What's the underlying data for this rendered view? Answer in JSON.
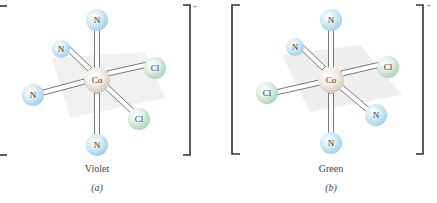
{
  "figure": {
    "panels": [
      {
        "id": "a",
        "caption": "Violet",
        "sublabel": "(a)",
        "charge": "+",
        "center": {
          "label": "Co",
          "x": 97,
          "y": 80,
          "r": 13
        },
        "ligands": [
          {
            "label": "N",
            "x": 97,
            "y": 20,
            "r": 11
          },
          {
            "label": "N",
            "x": 61,
            "y": 49,
            "r": 9
          },
          {
            "label": "Cl",
            "x": 155,
            "y": 68,
            "r": 11
          },
          {
            "label": "N",
            "x": 33,
            "y": 95,
            "r": 11
          },
          {
            "label": "Cl",
            "x": 139,
            "y": 119,
            "r": 11
          },
          {
            "label": "N",
            "x": 97,
            "y": 145,
            "r": 11
          }
        ]
      },
      {
        "id": "b",
        "caption": "Green",
        "sublabel": "(b)",
        "charge": "+",
        "center": {
          "label": "Co",
          "x": 331,
          "y": 80,
          "r": 13
        },
        "ligands": [
          {
            "label": "N",
            "x": 331,
            "y": 20,
            "r": 11
          },
          {
            "label": "N",
            "x": 295,
            "y": 47,
            "r": 9
          },
          {
            "label": "Cl",
            "x": 388,
            "y": 67,
            "r": 11
          },
          {
            "label": "Cl",
            "x": 267,
            "y": 93,
            "r": 11
          },
          {
            "label": "N",
            "x": 376,
            "y": 115,
            "r": 11
          },
          {
            "label": "N",
            "x": 331,
            "y": 143,
            "r": 11
          }
        ]
      }
    ],
    "colors": {
      "N": "#c4e3f3",
      "Cl": "#d4eadb",
      "Co": "#ede7dd",
      "plane": "#ececec",
      "bracket": "#333333"
    }
  }
}
